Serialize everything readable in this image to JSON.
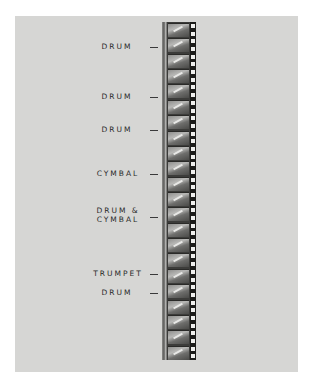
{
  "figure": {
    "labels": [
      {
        "text": "DRUM",
        "top": 42
      },
      {
        "text": "DRUM",
        "top": 92
      },
      {
        "text": "DRUM",
        "top": 125
      },
      {
        "text": "CYMBAL",
        "top": 169
      },
      {
        "line1": "DRUM &",
        "line2": "CYMBAL",
        "top": 206
      },
      {
        "text": "TRUMPET",
        "top": 269
      },
      {
        "text": "DRUM",
        "top": 288
      }
    ],
    "frame_count": 22,
    "colors": {
      "paper": "#d6d6d4",
      "background": "#ffffff",
      "ink": "#2a2a2a"
    }
  }
}
